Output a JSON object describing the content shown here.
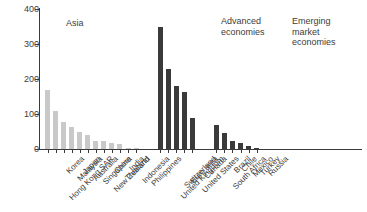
{
  "chart_data": {
    "type": "bar",
    "title": "",
    "xlabel": "",
    "ylabel": "",
    "ylim": [
      0,
      400
    ],
    "yticks": [
      0,
      100,
      200,
      300,
      400
    ],
    "grid": false,
    "legend": "none",
    "annotations": [
      {
        "text": "Asia",
        "group": "asia"
      },
      {
        "text": "Advanced\neconomies",
        "group": "advanced"
      },
      {
        "text": "Emerging\nmarket\neconomies",
        "group": "emerging"
      }
    ],
    "colors": {
      "asia": "#c9c9c9",
      "advanced": "#3a3a3a",
      "emerging": "#3a3a3a",
      "axis": "#3a3a3a",
      "text": "#3c3c3c",
      "background": "#ffffff"
    },
    "groups": [
      {
        "name": "Asia",
        "color": "#c9c9c9",
        "categories": [
          "Hong Kong SAR",
          "Korea",
          "Malaysia",
          "Japan",
          "Australia",
          "Singapore",
          "New Zealand",
          "China",
          "Thailand",
          "India",
          "Indonesia",
          "Philippines"
        ],
        "values": [
          169,
          108,
          76,
          64,
          48,
          39,
          24,
          22,
          17,
          13,
          4,
          3
        ]
      },
      {
        "name": "Advanced economies",
        "color": "#3a3a3a",
        "categories": [
          "United Kingdom",
          "Switzerland",
          "Euro area",
          "United States",
          "Canada"
        ],
        "values": [
          350,
          230,
          180,
          162,
          88
        ]
      },
      {
        "name": "Emerging market economies",
        "color": "#3a3a3a",
        "categories": [
          "South Africa",
          "Brazil",
          "Chile",
          "Mexico",
          "Turkey",
          "Russia"
        ],
        "values": [
          70,
          47,
          22,
          18,
          8,
          2
        ]
      }
    ],
    "categories": [
      "Hong Kong SAR",
      "Korea",
      "Malaysia",
      "Japan",
      "Australia",
      "Singapore",
      "New Zealand",
      "China",
      "Thailand",
      "India",
      "Indonesia",
      "Philippines",
      "United Kingdom",
      "Switzerland",
      "Euro area",
      "United States",
      "Canada",
      "South Africa",
      "Brazil",
      "Chile",
      "Mexico",
      "Turkey",
      "Russia"
    ],
    "values": [
      169,
      108,
      76,
      64,
      48,
      39,
      24,
      22,
      17,
      13,
      4,
      3,
      350,
      230,
      180,
      162,
      88,
      70,
      47,
      22,
      18,
      8,
      2
    ]
  }
}
